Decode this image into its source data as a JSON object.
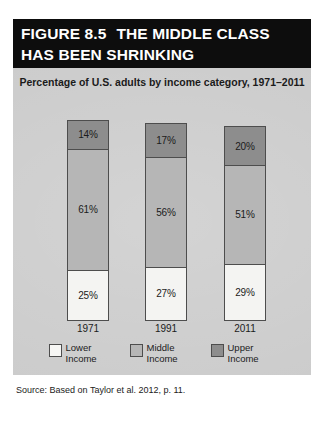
{
  "figure": {
    "number_label": "FIGURE 8.5",
    "title": "THE MIDDLE CLASS HAS BEEN SHRINKING",
    "source": "Source: Based on Taylor et al. 2012, p. 11."
  },
  "chart_data": {
    "type": "bar",
    "variant": "stacked-100",
    "title": "Percentage of U.S. adults by income category, 1971–2011",
    "subtitle": "",
    "xlabel": "",
    "ylabel": "",
    "ylim": [
      0,
      100
    ],
    "grid": false,
    "legend_position": "bottom",
    "categories": [
      "1971",
      "1991",
      "2011"
    ],
    "series": [
      {
        "name": "Lower Income",
        "legend_label": "Lower\nIncome",
        "color": "#f4f4f2",
        "values": [
          25,
          27,
          29
        ],
        "labels": [
          "25%",
          "27%",
          "29%"
        ]
      },
      {
        "name": "Middle Income",
        "legend_label": "Middle\nIncome",
        "color": "#b6b6b6",
        "values": [
          61,
          56,
          51
        ],
        "labels": [
          "61%",
          "56%",
          "51%"
        ]
      },
      {
        "name": "Upper Income",
        "legend_label": "Upper\nIncome",
        "color": "#8d8d8d",
        "values": [
          14,
          17,
          20
        ],
        "labels": [
          "14%",
          "17%",
          "20%"
        ]
      }
    ],
    "bars": [
      {
        "category": "1971",
        "segments": [
          {
            "name": "Upper Income",
            "value": 14,
            "label": "14%"
          },
          {
            "name": "Middle Income",
            "value": 61,
            "label": "61%"
          },
          {
            "name": "Lower Income",
            "value": 25,
            "label": "25%"
          }
        ]
      },
      {
        "category": "1991",
        "segments": [
          {
            "name": "Upper Income",
            "value": 17,
            "label": "17%"
          },
          {
            "name": "Middle Income",
            "value": 56,
            "label": "56%"
          },
          {
            "name": "Lower Income",
            "value": 27,
            "label": "27%"
          }
        ]
      },
      {
        "category": "2011",
        "segments": [
          {
            "name": "Upper Income",
            "value": 20,
            "label": "20%"
          },
          {
            "name": "Middle Income",
            "value": 51,
            "label": "51%"
          },
          {
            "name": "Lower Income",
            "value": 29,
            "label": "29%"
          }
        ]
      }
    ]
  },
  "colors": {
    "title_bar_background": "#0d0d0d",
    "title_bar_text": "#ffffff",
    "panel_background": "#c9c9c9",
    "segment_border": "#4d4d4d",
    "body_text": "#1b1b1b",
    "page_background": "#ffffff"
  }
}
